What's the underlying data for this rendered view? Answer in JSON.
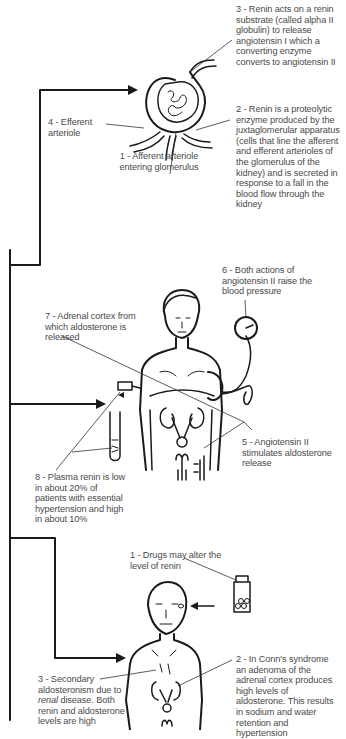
{
  "diagram": {
    "section_kidney": {
      "labels": [
        {
          "id": "k3",
          "text": "3 - Renin acts on a renin substrate (called alpha II globulin) to release angiotensin I which a converting enzyme converts to angiotensin II"
        },
        {
          "id": "k4",
          "text": "4 - Efferent arteriole"
        },
        {
          "id": "k2",
          "text": "2 - Renin is a proteolytic enzyme produced by the juxtaglomerular apparatus (cells that line the afferent and efferent arterioles of the glomerulus of the kidney) and is secreted in response to a fall in the blood flow through the kidney"
        },
        {
          "id": "k1",
          "text": "1 - Afferent arteriole entering glomerulus"
        }
      ]
    },
    "section_body": {
      "labels": [
        {
          "id": "b6",
          "text": "6 - Both actions of angiotensin II raise the blood pressure"
        },
        {
          "id": "b7",
          "text": "7 - Adrenal cortex from which aldosterone is released"
        },
        {
          "id": "b5",
          "text": "5 - Angiotensin II stimulates aldosterone release"
        },
        {
          "id": "b8",
          "text": "8 - Plasma renin is low in about 20% of patients with essential hypertension and high in about 10%"
        }
      ]
    },
    "section_patient": {
      "labels": [
        {
          "id": "p1",
          "text": "1 - Drugs may alter the level of renin"
        },
        {
          "id": "p2",
          "text": "2 - In Conn's syndrome an adenoma of the adrenal cortex produces high levels of aldosterone. This results in sodium and water retention and hypertension"
        },
        {
          "id": "p3_pre",
          "text": "3 - Secondary aldosteronism due to "
        },
        {
          "id": "p3_em",
          "text": "renal"
        },
        {
          "id": "p3_post",
          "text": " disease. Both renin and aldosterone levels are high"
        }
      ]
    }
  }
}
